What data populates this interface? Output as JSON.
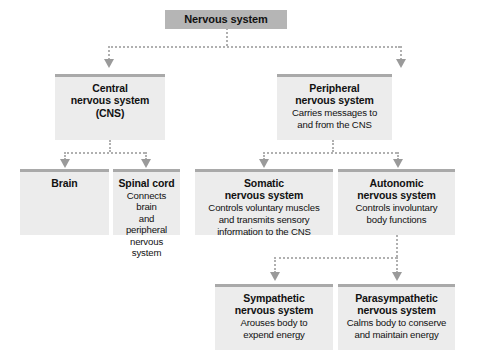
{
  "diagram": {
    "colors": {
      "root_fill": "#b5b5b5",
      "node_fill": "#ececec",
      "node_top_border": "#a9a9a9",
      "connector": "#b0b0b0",
      "arrowhead": "#9a9a9a",
      "text": "#111111",
      "background": "#ffffff"
    },
    "nodes": {
      "root": {
        "title": "Nervous system",
        "desc": ""
      },
      "central": {
        "title": "Central\nnervous system\n(CNS)",
        "title_line1": "Central",
        "title_line2": "nervous system",
        "title_line3": "(CNS)",
        "desc": ""
      },
      "peripheral": {
        "title_line1": "Peripheral",
        "title_line2": "nervous system",
        "desc_line1": "Carries messages to",
        "desc_line2": "and from the CNS"
      },
      "brain": {
        "title": "Brain",
        "desc": ""
      },
      "spinal_cord": {
        "title": "Spinal cord",
        "desc_line1": "Connects brain",
        "desc_line2": "and peripheral",
        "desc_line3": "nervous system"
      },
      "somatic": {
        "title_line1": "Somatic",
        "title_line2": "nervous system",
        "desc_line1": "Controls voluntary muscles",
        "desc_line2": "and transmits sensory",
        "desc_line3": "information to the CNS"
      },
      "autonomic": {
        "title_line1": "Autonomic",
        "title_line2": "nervous system",
        "desc_line1": "Controls involuntary",
        "desc_line2": "body functions"
      },
      "sympathetic": {
        "title_line1": "Sympathetic",
        "title_line2": "nervous system",
        "desc_line1": "Arouses body to",
        "desc_line2": "expend energy"
      },
      "parasympathetic": {
        "title_line1": "Parasympathetic",
        "title_line2": "nervous system",
        "desc_line1": "Calms body to conserve",
        "desc_line2": "and maintain energy"
      }
    }
  }
}
